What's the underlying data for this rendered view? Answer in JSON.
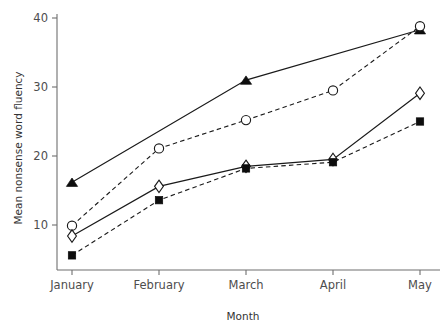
{
  "chart_data": {
    "type": "line",
    "title": "",
    "subtitle": "",
    "xlabel": "Month",
    "ylabel": "Mean nonsense word fluency",
    "categories": [
      "January",
      "February",
      "March",
      "April",
      "May"
    ],
    "x_tick_labels": [
      "January",
      "February",
      "March",
      "April",
      "May"
    ],
    "y_tick_labels": [
      "10",
      "20",
      "30",
      "40"
    ],
    "y_ticks": [
      10,
      20,
      30,
      40
    ],
    "ylim": [
      3,
      40
    ],
    "xlim_categories": 5,
    "grid": false,
    "legend_position": "none",
    "series": [
      {
        "name": "filled-triangle-solid",
        "marker": "triangle-filled",
        "line_style": "solid",
        "color": "#0d0d0d",
        "values": [
          16.2,
          null,
          31.0,
          null,
          38.3
        ]
      },
      {
        "name": "open-circle-dashed",
        "marker": "circle-open",
        "line_style": "dashed",
        "color": "#1a1a1a",
        "values": [
          9.9,
          21.1,
          25.2,
          29.5,
          38.8
        ]
      },
      {
        "name": "open-diamond-solid",
        "marker": "diamond-open",
        "line_style": "solid",
        "color": "#1a1a1a",
        "values": [
          8.4,
          15.6,
          18.5,
          19.5,
          29.1
        ]
      },
      {
        "name": "filled-square-dashed",
        "marker": "square-filled",
        "line_style": "dashed",
        "color": "#0d0d0d",
        "values": [
          5.6,
          13.6,
          18.2,
          19.1,
          25.0
        ]
      }
    ]
  },
  "axes": {
    "y_axis_label": "Mean nonsense word fluency",
    "x_axis_label": "Month"
  },
  "colors": {
    "background": "#ffffff",
    "axis": "#6f6f6f",
    "ink": "#1a1a1a",
    "tick_text": "#4d4d4d"
  }
}
